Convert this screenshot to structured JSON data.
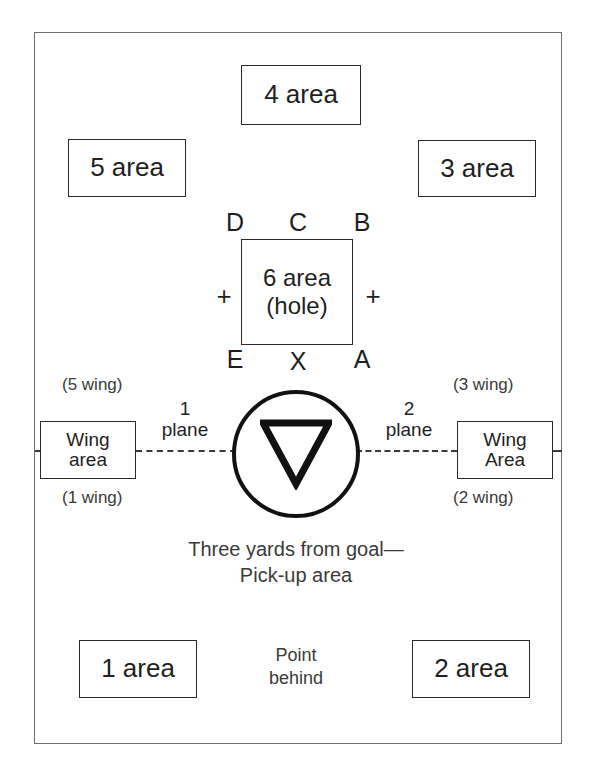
{
  "diagram": {
    "field_border_color": "#6f6f6f",
    "box_border_color": "#2b2b2b",
    "text_color": "#1f1f1f",
    "crease_color": "#111111"
  },
  "areas": {
    "top": {
      "label": "4 area"
    },
    "upper_left": {
      "label": "5 area"
    },
    "upper_right": {
      "label": "3 area"
    },
    "lower_left": {
      "label": "1 area"
    },
    "lower_right": {
      "label": "2 area"
    },
    "hole": {
      "label": "6 area\n(hole)"
    }
  },
  "hole_positions": {
    "top_left": "D",
    "top_center": "C",
    "top_right": "B",
    "bottom_left": "E",
    "bottom_center": "X",
    "bottom_right": "A",
    "left_marker": "+",
    "right_marker": "+"
  },
  "wings": {
    "left": {
      "box_label": "Wing\narea",
      "note_above": "(5 wing)",
      "note_below": "(1 wing)"
    },
    "right": {
      "box_label": "Wing\nArea",
      "note_above": "(3 wing)",
      "note_below": "(2 wing)"
    }
  },
  "planes": {
    "left": {
      "number": "1",
      "word": "plane"
    },
    "right": {
      "number": "2",
      "word": "plane"
    }
  },
  "crease": {
    "icon": "triangle-down-icon",
    "caption": "Three yards from goal—\nPick-up area"
  },
  "point_behind": {
    "label": "Point\nbehind"
  }
}
